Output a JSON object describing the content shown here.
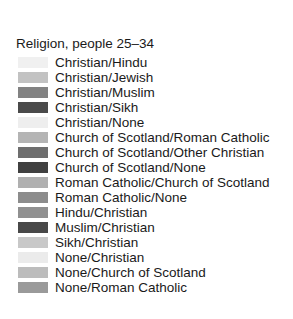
{
  "legend": {
    "title": "Religion, people 25–34",
    "background": "#ffffff",
    "text_color": "#1a1a1a",
    "entries": [
      {
        "label": "Christian/Hindu",
        "color": "#f0f0f0"
      },
      {
        "label": "Christian/Jewish",
        "color": "#c2c2c2"
      },
      {
        "label": "Christian/Muslim",
        "color": "#828282"
      },
      {
        "label": "Christian/Sikh",
        "color": "#4a4a4a"
      },
      {
        "label": "Christian/None",
        "color": "#eeeeee"
      },
      {
        "label": "Church of Scotland/Roman Catholic",
        "color": "#b4b4b4"
      },
      {
        "label": "Church of Scotland/Other Christian",
        "color": "#6e6e6e"
      },
      {
        "label": "Church of Scotland/None",
        "color": "#404040"
      },
      {
        "label": "Roman Catholic/Church of Scotland",
        "color": "#b0b0b0"
      },
      {
        "label": "Roman Catholic/None",
        "color": "#8c8c8c"
      },
      {
        "label": "Hindu/Christian",
        "color": "#909090"
      },
      {
        "label": "Muslim/Christian",
        "color": "#484848"
      },
      {
        "label": "Sikh/Christian",
        "color": "#c8c8c8"
      },
      {
        "label": "None/Christian",
        "color": "#ebebeb"
      },
      {
        "label": "None/Church of Scotland",
        "color": "#bcbcbc"
      },
      {
        "label": "None/Roman Catholic",
        "color": "#9a9a9a"
      }
    ]
  },
  "chart_data": {
    "type": "table",
    "title": "Religion, people 25–34",
    "xlabel": "",
    "ylabel": "",
    "legend_position": "standalone",
    "grid": false,
    "categories": [
      "Christian/Hindu",
      "Christian/Jewish",
      "Christian/Muslim",
      "Christian/Sikh",
      "Christian/None",
      "Church of Scotland/Roman Catholic",
      "Church of Scotland/Other Christian",
      "Church of Scotland/None",
      "Roman Catholic/Church of Scotland",
      "Roman Catholic/None",
      "Hindu/Christian",
      "Muslim/Christian",
      "Sikh/Christian",
      "None/Christian",
      "None/Church of Scotland",
      "None/Roman Catholic"
    ],
    "colors": [
      "#f0f0f0",
      "#c2c2c2",
      "#828282",
      "#4a4a4a",
      "#eeeeee",
      "#b4b4b4",
      "#6e6e6e",
      "#404040",
      "#b0b0b0",
      "#8c8c8c",
      "#909090",
      "#484848",
      "#c8c8c8",
      "#ebebeb",
      "#bcbcbc",
      "#9a9a9a"
    ]
  }
}
